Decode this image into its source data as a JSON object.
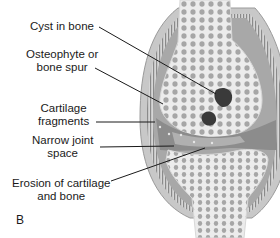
{
  "figure": {
    "panel_letter": "B",
    "labels": [
      {
        "id": "cyst",
        "line1": "Cyst in bone",
        "line2": ""
      },
      {
        "id": "osteophyte",
        "line1": "Osteophyte or",
        "line2": "bone spur"
      },
      {
        "id": "fragments",
        "line1": "Cartilage",
        "line2": "fragments"
      },
      {
        "id": "narrow",
        "line1": "Narrow joint",
        "line2": "space"
      },
      {
        "id": "erosion",
        "line1": "Erosion of cartilage",
        "line2": "and bone"
      }
    ],
    "colors": {
      "bone_light": "#e8e8e8",
      "bone_pores": "#9a9a9a",
      "cartilage": "#8c8c8c",
      "capsule": "#b4b4b4",
      "cyst": "#3a3a3a",
      "leader_line": "#1a1a1a"
    }
  }
}
